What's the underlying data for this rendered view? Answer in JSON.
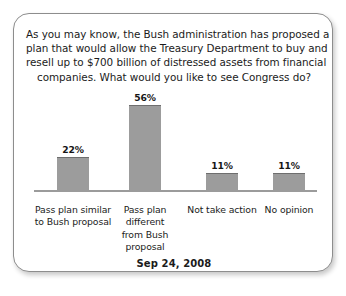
{
  "card": {
    "question_lines": [
      "As you may know, the Bush administration has proposed a",
      "plan that would allow the Treasury Department to buy and",
      "resell up to $700 billion of distressed assets from financial",
      "companies. What would you like to see Congress do?"
    ],
    "date_caption": "Sep 24, 2008"
  },
  "chart_data": {
    "type": "bar",
    "subtitle": "Sep 24, 2008",
    "xlabel": "",
    "ylabel": "",
    "ylim": [
      0,
      60
    ],
    "grid": false,
    "legend": "none",
    "value_suffix": "%",
    "bar_color": "#9c9c9c",
    "bar_edge_color": "#6e6e6e",
    "axis_color": "#9b9b9b",
    "categories": [
      "Pass plan similar to Bush proposal",
      "Pass plan different from Bush proposal",
      "Not take action",
      "No opinion"
    ],
    "category_lines": [
      [
        "Pass plan similar",
        "to Bush proposal"
      ],
      [
        "Pass plan",
        "different",
        "from Bush",
        "proposal"
      ],
      [
        "Not take action"
      ],
      [
        "No opinion"
      ]
    ],
    "values": [
      22,
      56,
      11,
      11
    ],
    "value_labels": [
      "22%",
      "56%",
      "11%",
      "11%"
    ]
  }
}
